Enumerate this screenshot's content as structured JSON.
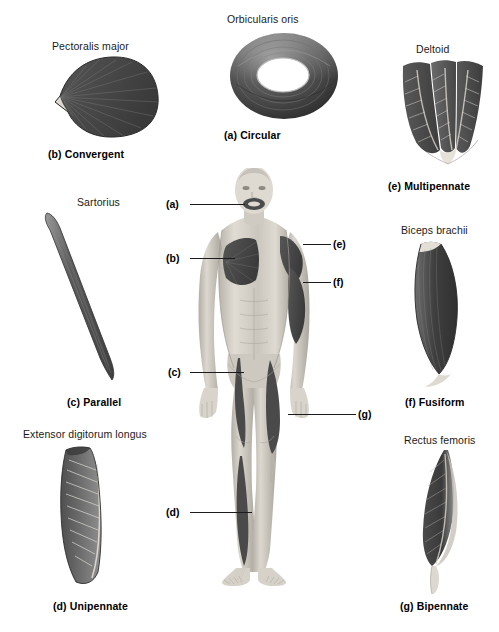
{
  "figure": {
    "width": 499,
    "height": 632
  },
  "panels": [
    {
      "key": "a",
      "muscle_name": "Orbicularis oris",
      "caption": "(a) Circular",
      "shape": "circular-ring",
      "name_x": 227,
      "name_y": 13,
      "caption_x": 224,
      "caption_y": 129
    },
    {
      "key": "b",
      "muscle_name": "Pectoralis major",
      "caption": "(b) Convergent",
      "shape": "convergent-fan",
      "name_x": 52,
      "name_y": 40,
      "caption_x": 48,
      "caption_y": 148
    },
    {
      "key": "c",
      "muscle_name": "Sartorius",
      "caption": "(c) Parallel",
      "shape": "parallel-strap",
      "name_x": 77,
      "name_y": 196,
      "caption_x": 67,
      "caption_y": 396
    },
    {
      "key": "d",
      "muscle_name": "Extensor digitorum longus",
      "caption": "(d) Unipennate",
      "shape": "unipennate-block",
      "name_x": 23,
      "name_y": 428,
      "caption_x": 53,
      "caption_y": 600
    },
    {
      "key": "e",
      "muscle_name": "Deltoid",
      "caption": "(e) Multipennate",
      "shape": "multipennate-bundle",
      "name_x": 416,
      "name_y": 43,
      "caption_x": 388,
      "caption_y": 180
    },
    {
      "key": "f",
      "muscle_name": "Biceps brachii",
      "caption": "(f) Fusiform",
      "shape": "fusiform-spindle",
      "name_x": 401,
      "name_y": 224,
      "caption_x": 405,
      "caption_y": 396
    },
    {
      "key": "g",
      "muscle_name": "Rectus femoris",
      "caption": "(g) Bipennate",
      "shape": "bipennate-feather",
      "name_x": 404,
      "name_y": 434,
      "caption_x": 400,
      "caption_y": 600
    }
  ],
  "leaders": [
    {
      "key": "a",
      "label": "(a)",
      "label_x": 166,
      "label_y": 198,
      "line_x": 190,
      "line_y": 204,
      "line_w": 55
    },
    {
      "key": "b",
      "label": "(b)",
      "label_x": 166,
      "label_y": 252,
      "line_x": 190,
      "line_y": 258,
      "line_w": 45
    },
    {
      "key": "c",
      "label": "(c)",
      "label_x": 168,
      "label_y": 366,
      "line_x": 190,
      "line_y": 372,
      "line_w": 54
    },
    {
      "key": "d",
      "label": "(d)",
      "label_x": 166,
      "label_y": 506,
      "line_x": 190,
      "line_y": 512,
      "line_w": 62
    },
    {
      "key": "e",
      "label": "(e)",
      "label_x": 333,
      "label_y": 238,
      "line_x": 303,
      "line_y": 244,
      "line_w": 28
    },
    {
      "key": "f",
      "label": "(f)",
      "label_x": 333,
      "label_y": 276,
      "line_x": 303,
      "line_y": 282,
      "line_w": 28
    },
    {
      "key": "g",
      "label": "(g)",
      "label_x": 358,
      "label_y": 408,
      "line_x": 288,
      "line_y": 414,
      "line_w": 68
    }
  ],
  "body_figure": {
    "description": "anterior view of male human body with highlighted muscles",
    "skin_tone": "#cfcbc4",
    "muscle_tone": "#4a4a4a"
  },
  "colors": {
    "muscle_dark": "#3f3f3f",
    "muscle_mid": "#6b6b6b",
    "muscle_light": "#a8a8a8",
    "tendon": "#e2ded6",
    "skin": "#d2cdc5",
    "text": "#1a1a1a",
    "leader": "#1b1b1b"
  },
  "bottom_text": "caption text cropped at page edge"
}
